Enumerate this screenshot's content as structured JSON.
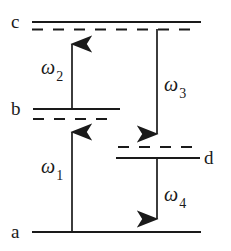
{
  "figure": {
    "kind": "energy-level-diagram",
    "title": "",
    "background_color": "#ffffff",
    "line_color": "#1a1a1a"
  },
  "levels": [
    {
      "id": "c",
      "label": "c",
      "label_side": "left",
      "solid_line": {
        "x1": 32,
        "x2": 201,
        "y": 22
      },
      "dashed_line": {
        "x1": 32,
        "x2": 200,
        "y": 29
      },
      "label_pos": {
        "x": 11,
        "y": 13
      }
    },
    {
      "id": "b",
      "label": "b",
      "label_side": "left",
      "solid_line": {
        "x1": 33,
        "x2": 120,
        "y": 109
      },
      "dashed_line": {
        "x1": 33,
        "x2": 114,
        "y": 119
      },
      "label_pos": {
        "x": 11,
        "y": 100
      }
    },
    {
      "id": "d",
      "label": "d",
      "label_side": "right",
      "solid_line": {
        "x1": 116,
        "x2": 200,
        "y": 158
      },
      "dashed_line": {
        "x1": 118,
        "x2": 197,
        "y": 147
      },
      "label_pos": {
        "x": 204,
        "y": 149
      }
    },
    {
      "id": "a",
      "label": "a",
      "label_side": "left",
      "solid_line": {
        "x1": 32,
        "x2": 201,
        "y": 232
      },
      "dashed_line": null,
      "label_pos": {
        "x": 11,
        "y": 223
      }
    }
  ],
  "transitions": [
    {
      "id": "omega1",
      "symbol": "ω",
      "subscript": "1",
      "direction": "up",
      "from_level": "a",
      "to_level": "b",
      "x": 72,
      "y_start": 232,
      "y_end": 119,
      "label_pos": {
        "x": 41,
        "y": 158
      }
    },
    {
      "id": "omega2",
      "symbol": "ω",
      "subscript": "2",
      "direction": "up",
      "from_level": "b",
      "to_level": "c",
      "x": 72,
      "y_start": 109,
      "y_end": 31,
      "label_pos": {
        "x": 41,
        "y": 59
      }
    },
    {
      "id": "omega3",
      "symbol": "ω",
      "subscript": "3",
      "direction": "down",
      "from_level": "c",
      "to_level": "d",
      "x": 157,
      "y_start": 29,
      "y_end": 147,
      "label_pos": {
        "x": 164,
        "y": 76
      }
    },
    {
      "id": "omega4",
      "symbol": "ω",
      "subscript": "4",
      "direction": "down",
      "from_level": "d",
      "to_level": "a",
      "x": 157,
      "y_start": 158,
      "y_end": 232,
      "label_pos": {
        "x": 164,
        "y": 186
      }
    }
  ]
}
